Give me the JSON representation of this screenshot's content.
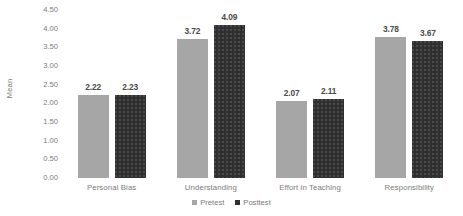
{
  "chart_data": {
    "type": "bar",
    "title": "",
    "xlabel": "",
    "ylabel": "Mean",
    "ylim": [
      0.0,
      4.5
    ],
    "ytick_step": 0.5,
    "grid": false,
    "legend_position": "bottom-center",
    "categories": [
      "Personal Bias",
      "Understanding",
      "Effort in Teaching",
      "Responsibility"
    ],
    "series": [
      {
        "name": "Pretest",
        "color": "#a6a6a6",
        "values": [
          2.22,
          3.72,
          2.07,
          3.78
        ],
        "labels": [
          "2.22",
          "3.72",
          "2.07",
          "3.78"
        ]
      },
      {
        "name": "Posttest",
        "color": "#2f2f2f",
        "values": [
          2.23,
          4.09,
          2.11,
          3.67
        ],
        "labels": [
          "2.23",
          "4.09",
          "2.11",
          "3.67"
        ]
      }
    ],
    "ytick_labels": [
      "4.50",
      "4.00",
      "3.50",
      "3.00",
      "2.50",
      "2.00",
      "1.50",
      "1.00",
      "0.50",
      "0.00"
    ],
    "ytick_values": [
      4.5,
      4.0,
      3.5,
      3.0,
      2.5,
      2.0,
      1.5,
      1.0,
      0.5,
      0.0
    ]
  },
  "axis": {
    "y_title": "Mean"
  },
  "legend": {
    "items": [
      {
        "label": "Pretest"
      },
      {
        "label": "Posttest"
      }
    ]
  }
}
